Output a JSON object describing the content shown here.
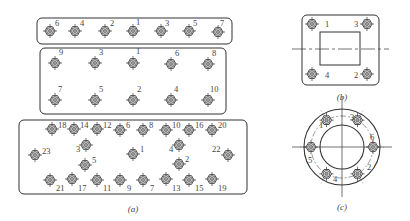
{
  "colors": {
    "line": "#333333",
    "background": "#ffffff",
    "bolt_fill": "#9a9a9a"
  },
  "panels": {
    "a": {
      "caption": "(a)",
      "top_row": {
        "box": [
          37,
          18,
          195,
          26
        ],
        "bolts": [
          {
            "x": 50,
            "y": 31,
            "label": "6",
            "lx": 55,
            "ly": 26
          },
          {
            "x": 75,
            "y": 31,
            "label": "4",
            "lx": 80,
            "ly": 26
          },
          {
            "x": 105,
            "y": 31,
            "label": "2",
            "lx": 110,
            "ly": 26
          },
          {
            "x": 133,
            "y": 31,
            "label": "1",
            "lx": 136,
            "ly": 25
          },
          {
            "x": 161,
            "y": 31,
            "label": "3",
            "lx": 165,
            "ly": 26
          },
          {
            "x": 189,
            "y": 31,
            "label": "5",
            "lx": 193,
            "ly": 26
          },
          {
            "x": 218,
            "y": 32,
            "label": "7",
            "lx": 220,
            "ly": 26
          }
        ]
      },
      "middle_grid": {
        "box": [
          40,
          48,
          186,
          66
        ],
        "bolts": [
          {
            "x": 55,
            "y": 63,
            "label": "9",
            "lx": 59,
            "ly": 55
          },
          {
            "x": 95,
            "y": 63,
            "label": "3",
            "lx": 99,
            "ly": 55
          },
          {
            "x": 133,
            "y": 63,
            "label": "1",
            "lx": 136,
            "ly": 54
          },
          {
            "x": 171,
            "y": 64,
            "label": "6",
            "lx": 175,
            "ly": 56
          },
          {
            "x": 208,
            "y": 64,
            "label": "8",
            "lx": 212,
            "ly": 56
          },
          {
            "x": 55,
            "y": 100,
            "label": "7",
            "lx": 58,
            "ly": 92
          },
          {
            "x": 95,
            "y": 100,
            "label": "5",
            "lx": 99,
            "ly": 92
          },
          {
            "x": 133,
            "y": 100,
            "label": "2",
            "lx": 137,
            "ly": 92
          },
          {
            "x": 171,
            "y": 100,
            "label": "4",
            "lx": 174,
            "ly": 92
          },
          {
            "x": 208,
            "y": 100,
            "label": "10",
            "lx": 210,
            "ly": 92
          }
        ]
      },
      "bottom_grid": {
        "box": [
          19,
          120,
          228,
          74
        ],
        "bolts": [
          {
            "x": 52,
            "y": 129,
            "label": "18",
            "lx": 58,
            "ly": 128
          },
          {
            "x": 74,
            "y": 129,
            "label": "14",
            "lx": 80,
            "ly": 128
          },
          {
            "x": 97,
            "y": 129,
            "label": "12",
            "lx": 103,
            "ly": 128
          },
          {
            "x": 120,
            "y": 130,
            "label": "6",
            "lx": 126,
            "ly": 128
          },
          {
            "x": 143,
            "y": 130,
            "label": "8",
            "lx": 149,
            "ly": 128
          },
          {
            "x": 166,
            "y": 130,
            "label": "10",
            "lx": 172,
            "ly": 128
          },
          {
            "x": 189,
            "y": 130,
            "label": "16",
            "lx": 195,
            "ly": 128
          },
          {
            "x": 212,
            "y": 130,
            "label": "20",
            "lx": 218,
            "ly": 128
          },
          {
            "x": 86,
            "y": 145,
            "label": "3",
            "lx": 76,
            "ly": 152
          },
          {
            "x": 179,
            "y": 145,
            "label": "4",
            "lx": 169,
            "ly": 152
          },
          {
            "x": 35,
            "y": 155,
            "label": "23",
            "lx": 42,
            "ly": 154
          },
          {
            "x": 133,
            "y": 154,
            "label": "1",
            "lx": 140,
            "ly": 152
          },
          {
            "x": 228,
            "y": 155,
            "label": "22",
            "lx": 212,
            "ly": 152
          },
          {
            "x": 85,
            "y": 165,
            "label": "5",
            "lx": 92,
            "ly": 163
          },
          {
            "x": 179,
            "y": 164,
            "label": "2",
            "lx": 185,
            "ly": 162
          },
          {
            "x": 50,
            "y": 180,
            "label": "21",
            "lx": 56,
            "ly": 191
          },
          {
            "x": 72,
            "y": 179,
            "label": "17",
            "lx": 78,
            "ly": 191
          },
          {
            "x": 97,
            "y": 180,
            "label": "11",
            "lx": 103,
            "ly": 191
          },
          {
            "x": 120,
            "y": 180,
            "label": "9",
            "lx": 127,
            "ly": 191
          },
          {
            "x": 143,
            "y": 180,
            "label": "7",
            "lx": 150,
            "ly": 191
          },
          {
            "x": 166,
            "y": 179,
            "label": "13",
            "lx": 172,
            "ly": 191
          },
          {
            "x": 189,
            "y": 180,
            "label": "15",
            "lx": 195,
            "ly": 191
          },
          {
            "x": 212,
            "y": 179,
            "label": "19",
            "lx": 218,
            "ly": 191
          }
        ]
      }
    },
    "b": {
      "caption": "(b)",
      "box": [
        302,
        15,
        77,
        70
      ],
      "inner_square": [
        320,
        32,
        40,
        33
      ],
      "centerline_y": 49,
      "bolts": [
        {
          "x": 312,
          "y": 24,
          "label": "1",
          "lx": 325,
          "ly": 27
        },
        {
          "x": 367,
          "y": 24,
          "label": "3",
          "lx": 354,
          "ly": 27
        },
        {
          "x": 312,
          "y": 74,
          "label": "4",
          "lx": 325,
          "ly": 78
        },
        {
          "x": 367,
          "y": 74,
          "label": "2",
          "lx": 354,
          "ly": 78
        }
      ]
    },
    "c": {
      "caption": "(c)",
      "center": [
        342,
        147
      ],
      "outer_r": 38,
      "inner_r": 22,
      "bolt_circle_r": 31,
      "bolts": [
        {
          "angle": -120,
          "label": "1",
          "lx": 319,
          "ly": 128
        },
        {
          "angle": -60,
          "label": "3",
          "lx": 350,
          "ly": 120
        },
        {
          "angle": 0,
          "label": "6",
          "lx": 370,
          "ly": 140
        },
        {
          "angle": 60,
          "label": "2",
          "lx": 367,
          "ly": 170
        },
        {
          "angle": 120,
          "label": "4",
          "lx": 333,
          "ly": 182
        },
        {
          "angle": 180,
          "label": "5",
          "lx": 308,
          "ly": 163
        }
      ]
    }
  }
}
